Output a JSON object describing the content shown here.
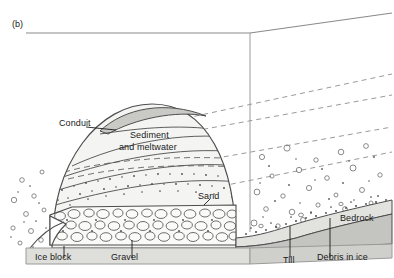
{
  "figure": {
    "panel_tag": "(b)",
    "kind": "geological-cross-section"
  },
  "labels": {
    "conduit": "Conduit",
    "sediment_line1": "Sediment",
    "sediment_line2": "and meltwater",
    "sand": "Sand",
    "gravel": "Gravel",
    "ice_block": "Ice block",
    "till": "Till",
    "debris_in_ice": "Debris in ice",
    "bedrock": "Bedrock"
  },
  "colors": {
    "stroke": "#4d4d4d",
    "stroke_light": "#8a8a8a",
    "text": "#1a1a1a",
    "fill_ice": "#ffffff",
    "fill_sediment": "#f2f2f0",
    "fill_sand": "#ededea",
    "fill_gravel": "#f7f7f5",
    "fill_conduit": "#c9c9c6",
    "fill_till": "#e2e2df",
    "fill_bedrock": "#c4c4c1",
    "fill_base": "#dededb",
    "dashed_layer": "#9a9a9a"
  },
  "elements": {
    "dashed_flow_lines": 4,
    "sediment_bands": 5,
    "bubble_count_left": 14,
    "bubble_count_right": 34,
    "gravel_clast_rows": 5
  }
}
